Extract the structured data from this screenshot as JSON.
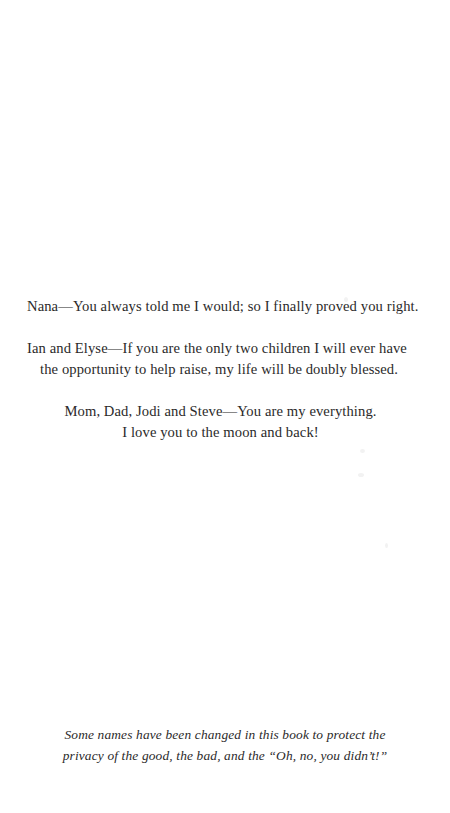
{
  "page": {
    "background_color": "#ffffff",
    "text_color": "#2b2a2a"
  },
  "dedication": {
    "paragraphs": [
      {
        "name": "nana",
        "lines": [
          "Nana—You always told me I would; so I finally proved you right."
        ]
      },
      {
        "name": "ian-and-elyse",
        "lines": [
          "Ian and Elyse—If you are the only two children I will ever have",
          "the opportunity to help raise, my life will be doubly blessed."
        ]
      },
      {
        "name": "mom-dad-jodi-steve",
        "lines": [
          "Mom, Dad, Jodi and Steve—You are my everything.",
          "I love you to the moon and back!"
        ]
      }
    ]
  },
  "note": {
    "lines": [
      "Some names have been changed in this book to protect the",
      "privacy of the good, the bad, and the “Oh, no, you didn’t!”"
    ]
  }
}
